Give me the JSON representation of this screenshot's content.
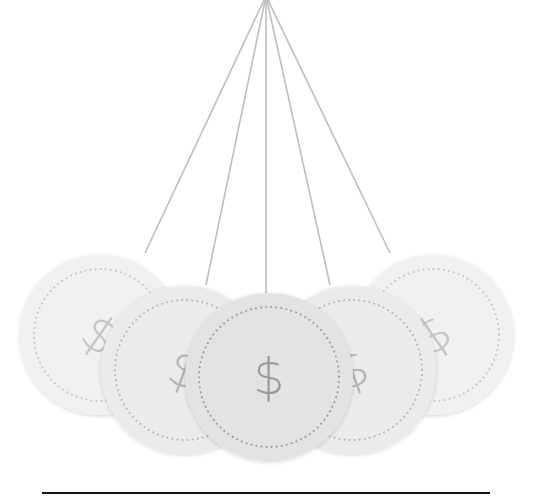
{
  "illustration": {
    "title": "Newton's cradle of coins",
    "pivot": {
      "x": 266,
      "y": -4
    },
    "string_color": "#bdbdbd",
    "baseline": {
      "x1": 42,
      "x2": 490,
      "y": 493,
      "color": "#111111",
      "thickness": 2
    },
    "coins": [
      {
        "id": "coin-1",
        "cx": 100,
        "cy": 335,
        "r": 80,
        "fill": "#f1f1f1",
        "symbol": "$",
        "symbol_color": "#c4c4c4",
        "rotation": 35,
        "string_end": {
          "x": 145,
          "y": 253
        }
      },
      {
        "id": "coin-5",
        "cx": 433,
        "cy": 335,
        "r": 80,
        "fill": "#f1f1f1",
        "symbol": "$",
        "symbol_color": "#c4c4c4",
        "rotation": -35,
        "string_end": {
          "x": 390,
          "y": 253
        }
      },
      {
        "id": "coin-2",
        "cx": 185,
        "cy": 370,
        "r": 84,
        "fill": "#ebebeb",
        "symbol": "$",
        "symbol_color": "#b3b3b3",
        "rotation": 20,
        "string_end": {
          "x": 206,
          "y": 285
        }
      },
      {
        "id": "coin-4",
        "cx": 352,
        "cy": 370,
        "r": 84,
        "fill": "#ebebeb",
        "symbol": "$",
        "symbol_color": "#b3b3b3",
        "rotation": -20,
        "string_end": {
          "x": 330,
          "y": 285
        }
      },
      {
        "id": "coin-3",
        "cx": 269,
        "cy": 377,
        "r": 84,
        "fill": "#e3e3e3",
        "symbol": "$",
        "symbol_color": "#9a9a9a",
        "rotation": 0,
        "string_end": {
          "x": 266,
          "y": 293
        }
      }
    ]
  }
}
